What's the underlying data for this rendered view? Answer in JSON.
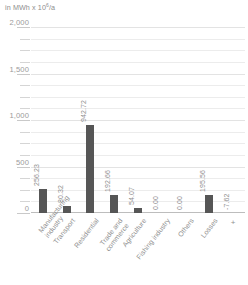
{
  "chart_data": {
    "type": "bar",
    "title": "",
    "subtitle": "",
    "unit_caption_prefix": "in MWh x 10",
    "unit_caption_exponent": "6",
    "unit_caption_suffix": "/a",
    "xlabel": "",
    "ylabel": "",
    "ylim": [
      0,
      2000
    ],
    "grid": true,
    "legend": "none",
    "bar_color": "#565656",
    "gridline_color": "#ececec",
    "axis_color": "#bdbdbd",
    "text_color": "#8f8f8f",
    "y_ticks": [
      {
        "value": 2000,
        "label": "2,000",
        "major": true
      },
      {
        "value": 1875,
        "label": "",
        "major": false
      },
      {
        "value": 1750,
        "label": "",
        "major": false
      },
      {
        "value": 1625,
        "label": "",
        "major": false
      },
      {
        "value": 1500,
        "label": "1,500",
        "major": true
      },
      {
        "value": 1375,
        "label": "",
        "major": false
      },
      {
        "value": 1250,
        "label": "",
        "major": false
      },
      {
        "value": 1125,
        "label": "",
        "major": false
      },
      {
        "value": 1000,
        "label": "1,000",
        "major": true
      },
      {
        "value": 875,
        "label": "",
        "major": false
      },
      {
        "value": 750,
        "label": "",
        "major": false
      },
      {
        "value": 625,
        "label": "",
        "major": false
      },
      {
        "value": 500,
        "label": "500",
        "major": true
      },
      {
        "value": 375,
        "label": "",
        "major": false
      },
      {
        "value": 250,
        "label": "",
        "major": false
      },
      {
        "value": 125,
        "label": "",
        "major": false
      },
      {
        "value": 0,
        "label": "0",
        "major": true
      }
    ],
    "categories": [
      "Manufacturing industry",
      "Transport",
      "Residential",
      "Trade and commerce",
      "Agriculture",
      "Fishing industry",
      "Others",
      "Losses",
      "+"
    ],
    "category_lines": [
      [
        "Manufacturing",
        "industry"
      ],
      [
        "Transport"
      ],
      [
        "Residential"
      ],
      [
        "Trade and",
        "commerce"
      ],
      [
        "Agriculture"
      ],
      [
        "Fishing industry"
      ],
      [
        "Others"
      ],
      [
        "Losses"
      ],
      [
        "+"
      ]
    ],
    "values": [
      256.23,
      80.32,
      942.72,
      192.66,
      54.07,
      0.0,
      0.0,
      195.56,
      -7.62
    ],
    "value_labels": [
      "256.23",
      "80.32",
      "942.72",
      "192.66",
      "54.07",
      "0.00",
      "0.00",
      "195.56",
      "-7.62"
    ]
  }
}
